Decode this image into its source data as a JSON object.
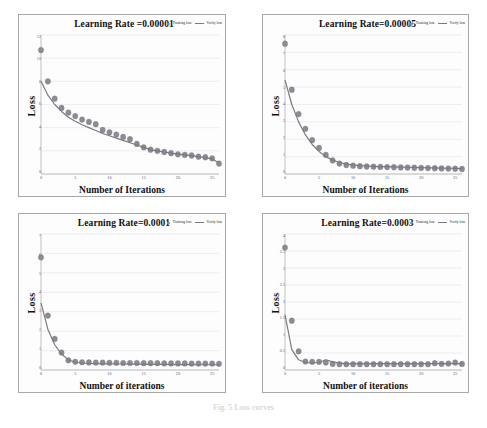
{
  "figure": {
    "caption": "Fig. 5  Loss curves",
    "legend": {
      "marker_label": "Training loss",
      "line_label": "Verify loss",
      "marker_color": "#8c8c94",
      "line_color": "#7a7a82"
    }
  },
  "chart_data": [
    {
      "type": "scatter",
      "title": "Learning Rate =0.00001",
      "xlabel": "Number of Iterations",
      "ylabel": "Loss",
      "xlim": [
        0,
        26
      ],
      "ylim": [
        0,
        12
      ],
      "xticks": [
        0,
        5,
        10,
        15,
        20,
        25
      ],
      "yticks": [
        0,
        2,
        4,
        6,
        8,
        10,
        12
      ],
      "grid": "horizontal",
      "legend_position": "top-right",
      "series": [
        {
          "name": "Training loss",
          "kind": "scatter",
          "x": [
            0,
            1,
            2,
            3,
            4,
            5,
            6,
            7,
            8,
            9,
            10,
            11,
            12,
            13,
            14,
            15,
            16,
            17,
            18,
            19,
            20,
            21,
            22,
            23,
            24,
            25,
            26
          ],
          "values": [
            10.7,
            8.0,
            6.5,
            5.7,
            5.3,
            5.0,
            4.7,
            4.5,
            4.3,
            3.8,
            3.6,
            3.4,
            3.2,
            3.0,
            2.6,
            2.3,
            2.1,
            2.0,
            1.9,
            1.8,
            1.7,
            1.65,
            1.6,
            1.5,
            1.45,
            1.35,
            0.9
          ]
        },
        {
          "name": "Verify loss",
          "kind": "line",
          "x": [
            0,
            1,
            2,
            3,
            4,
            5,
            6,
            7,
            8,
            9,
            10,
            11,
            12,
            13,
            14,
            15,
            16,
            17,
            18,
            19,
            20,
            21,
            22,
            23,
            24,
            25,
            26
          ],
          "values": [
            8.0,
            6.8,
            6.0,
            5.4,
            4.9,
            4.55,
            4.25,
            4.0,
            3.75,
            3.5,
            3.3,
            3.1,
            2.9,
            2.7,
            2.5,
            2.3,
            2.1,
            2.0,
            1.9,
            1.8,
            1.72,
            1.65,
            1.58,
            1.5,
            1.42,
            1.3,
            0.95
          ]
        }
      ]
    },
    {
      "type": "scatter",
      "title": "Learning Rate=0.00005",
      "xlabel": "Number of Iterations",
      "ylabel": "Loss",
      "xlim": [
        0,
        26
      ],
      "ylim": [
        0,
        8
      ],
      "xticks": [
        0,
        5,
        10,
        15,
        20,
        25
      ],
      "yticks": [
        0,
        1,
        2,
        3,
        4,
        5,
        6,
        7,
        8
      ],
      "grid": "horizontal",
      "legend_position": "top-right",
      "series": [
        {
          "name": "Training loss",
          "kind": "scatter",
          "x": [
            0,
            1,
            2,
            3,
            4,
            5,
            6,
            7,
            8,
            9,
            10,
            11,
            12,
            13,
            14,
            15,
            16,
            17,
            18,
            19,
            20,
            21,
            22,
            23,
            24,
            25,
            26
          ],
          "values": [
            7.5,
            4.85,
            3.45,
            2.6,
            1.95,
            1.5,
            1.1,
            0.78,
            0.6,
            0.52,
            0.48,
            0.45,
            0.43,
            0.42,
            0.41,
            0.4,
            0.39,
            0.38,
            0.37,
            0.36,
            0.35,
            0.34,
            0.33,
            0.32,
            0.31,
            0.3,
            0.29
          ]
        },
        {
          "name": "Verify loss",
          "kind": "line",
          "x": [
            0,
            1,
            2,
            3,
            4,
            5,
            6,
            7,
            8,
            9,
            10,
            11,
            12,
            13,
            14,
            15,
            16,
            17,
            18,
            19,
            20,
            21,
            22,
            23,
            24,
            25,
            26
          ],
          "values": [
            5.4,
            4.0,
            3.0,
            2.25,
            1.7,
            1.3,
            1.0,
            0.8,
            0.66,
            0.57,
            0.52,
            0.48,
            0.46,
            0.44,
            0.43,
            0.42,
            0.41,
            0.4,
            0.39,
            0.38,
            0.37,
            0.36,
            0.35,
            0.34,
            0.33,
            0.32,
            0.31
          ]
        }
      ]
    },
    {
      "type": "scatter",
      "title": "Learning Rate=0.0001",
      "xlabel": "Number of iterations",
      "ylabel": "Loss",
      "xlim": [
        0,
        26
      ],
      "ylim": [
        0,
        7
      ],
      "xticks": [
        0,
        5,
        10,
        15,
        20,
        25
      ],
      "yticks": [
        0,
        1,
        2,
        3,
        4,
        5,
        6,
        7
      ],
      "grid": "horizontal",
      "legend_position": "top-right",
      "series": [
        {
          "name": "Training loss",
          "kind": "scatter",
          "x": [
            0,
            1,
            2,
            3,
            4,
            5,
            6,
            7,
            8,
            9,
            10,
            11,
            12,
            13,
            14,
            15,
            16,
            17,
            18,
            19,
            20,
            21,
            22,
            23,
            24,
            25,
            26
          ],
          "values": [
            5.8,
            2.8,
            1.6,
            0.9,
            0.5,
            0.42,
            0.4,
            0.39,
            0.38,
            0.38,
            0.37,
            0.37,
            0.36,
            0.36,
            0.36,
            0.35,
            0.35,
            0.35,
            0.34,
            0.34,
            0.34,
            0.34,
            0.33,
            0.33,
            0.33,
            0.33,
            0.32
          ]
        },
        {
          "name": "Verify loss",
          "kind": "line",
          "x": [
            0,
            1,
            2,
            3,
            4,
            5,
            6,
            7,
            8,
            9,
            10,
            11,
            12,
            13,
            14,
            15,
            16,
            17,
            18,
            19,
            20,
            21,
            22,
            23,
            24,
            25,
            26
          ],
          "values": [
            3.45,
            2.1,
            1.3,
            0.82,
            0.52,
            0.4,
            0.36,
            0.34,
            0.33,
            0.32,
            0.32,
            0.31,
            0.31,
            0.3,
            0.3,
            0.3,
            0.29,
            0.29,
            0.29,
            0.28,
            0.28,
            0.28,
            0.28,
            0.27,
            0.27,
            0.27,
            0.26
          ]
        }
      ]
    },
    {
      "type": "scatter",
      "title": "Learning Rate=0.0003",
      "xlabel": "Number of iterations",
      "ylabel": "Loss",
      "xlim": [
        0,
        26
      ],
      "ylim": [
        0,
        4
      ],
      "xticks": [
        0,
        5,
        10,
        15,
        20,
        25
      ],
      "yticks": [
        0,
        0.5,
        1,
        1.5,
        2,
        2.5,
        3,
        3.5,
        4
      ],
      "grid": "horizontal",
      "legend_position": "top-right",
      "series": [
        {
          "name": "Training loss",
          "kind": "scatter",
          "x": [
            0,
            1,
            2,
            3,
            4,
            5,
            6,
            7,
            8,
            9,
            10,
            11,
            12,
            13,
            14,
            15,
            16,
            17,
            18,
            19,
            20,
            21,
            22,
            23,
            24,
            25,
            26
          ],
          "values": [
            3.6,
            1.45,
            0.55,
            0.25,
            0.24,
            0.24,
            0.22,
            0.18,
            0.17,
            0.17,
            0.17,
            0.17,
            0.17,
            0.17,
            0.17,
            0.17,
            0.17,
            0.17,
            0.17,
            0.17,
            0.17,
            0.17,
            0.2,
            0.18,
            0.19,
            0.22,
            0.18
          ]
        },
        {
          "name": "Verify loss",
          "kind": "line",
          "x": [
            0,
            1,
            2,
            3,
            4,
            5,
            6,
            7,
            8,
            9,
            10,
            11,
            12,
            13,
            14,
            15,
            16,
            17,
            18,
            19,
            20,
            21,
            22,
            23,
            24,
            25,
            26
          ],
          "values": [
            1.62,
            0.6,
            0.3,
            0.22,
            0.21,
            0.22,
            0.3,
            0.24,
            0.2,
            0.19,
            0.19,
            0.19,
            0.19,
            0.19,
            0.19,
            0.19,
            0.19,
            0.19,
            0.19,
            0.19,
            0.19,
            0.19,
            0.19,
            0.19,
            0.19,
            0.19,
            0.19
          ]
        }
      ]
    }
  ]
}
